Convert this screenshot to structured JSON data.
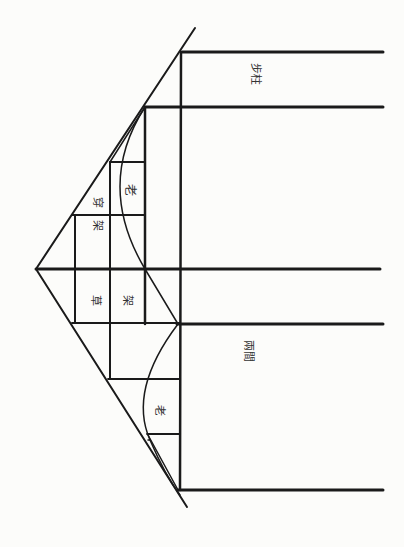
{
  "diagram": {
    "title": "",
    "style": {
      "ink_color": "#1a1a1a",
      "paper_color": "#fcfcfa",
      "label_color": "#3a3a3a"
    },
    "labels": {
      "step_pillar": "步柱",
      "chuan_char": "穿",
      "jia_char_upper": "架",
      "lao_upper": "老",
      "cao_char": "草",
      "jia_char_lower": "架",
      "two_bays": "兩間",
      "lao_lower": "老"
    },
    "annotations": [
      {
        "id": "step_pillar",
        "text": "步柱",
        "meaning": "step pillar"
      },
      {
        "id": "chuan_jia",
        "text": "穿架",
        "meaning": "through-frame"
      },
      {
        "id": "lao_upper",
        "text": "老",
        "meaning": "old / outer curve"
      },
      {
        "id": "cao_jia",
        "text": "草架",
        "meaning": "rough frame"
      },
      {
        "id": "two_bays",
        "text": "兩間",
        "meaning": "two bays"
      },
      {
        "id": "lao_lower",
        "text": "老",
        "meaning": "old / outer curve"
      }
    ]
  }
}
